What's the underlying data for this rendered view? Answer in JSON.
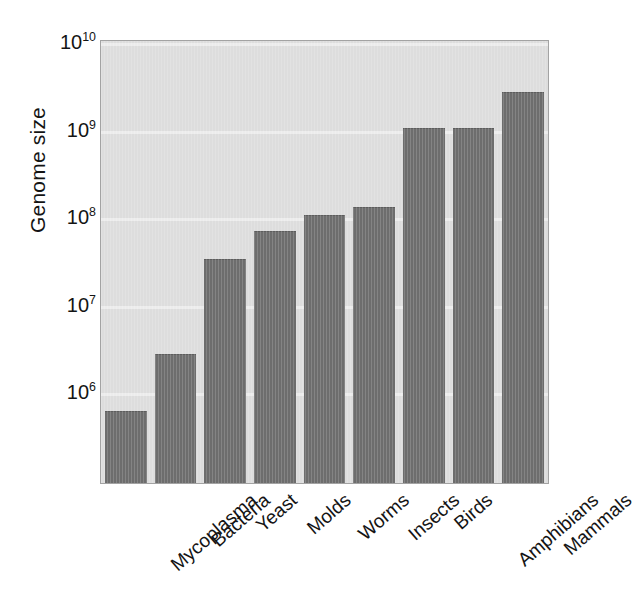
{
  "chart_data": {
    "type": "bar",
    "title": "",
    "xlabel": "",
    "ylabel": "Genome size",
    "yscale": "log",
    "ylim": [
      300000,
      10000000000
    ],
    "grid": true,
    "legend": null,
    "bar_color": "#6d6d6d",
    "plot_background": "#dddddd",
    "gridline_color": "#eeeeee",
    "categories": [
      "Mycoplasma",
      "Bacteria",
      "Yeast",
      "Molds",
      "Worms",
      "Insects",
      "Birds",
      "Amphibians",
      "Mammals"
    ],
    "values": [
      600000,
      2700000,
      33000000,
      70000000,
      105000000,
      130000000,
      1050000000,
      1050000000,
      2700000000
    ],
    "value_labels": [
      "6×10⁵",
      "2.7×10⁶",
      "3.3×10⁷",
      "7×10⁷",
      "1.05×10⁸",
      "1.3×10⁸",
      "1.05×10⁹",
      "1.05×10⁹",
      "2.7×10⁹"
    ],
    "yticks": [
      {
        "value": 10000000000,
        "mantissa": "10",
        "exponent": "10"
      },
      {
        "value": 1000000000,
        "mantissa": "10",
        "exponent": "9"
      },
      {
        "value": 100000000,
        "mantissa": "10",
        "exponent": "8"
      },
      {
        "value": 10000000,
        "mantissa": "10",
        "exponent": "7"
      },
      {
        "value": 1000000,
        "mantissa": "10",
        "exponent": "6"
      }
    ]
  }
}
